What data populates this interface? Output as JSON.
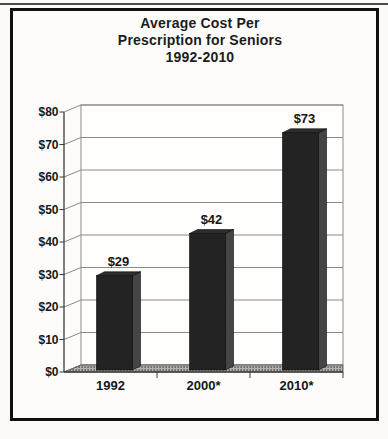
{
  "figure": {
    "title_line1": "Average Cost Per",
    "title_line2": "Prescription for Seniors",
    "title_line3": "1992-2010"
  },
  "chart_data": {
    "type": "bar",
    "style": "3d-column",
    "title": "Average Cost Per Prescription for Seniors 1992-2010",
    "categories": [
      "1992",
      "2000*",
      "2010*"
    ],
    "values": [
      29,
      42,
      73
    ],
    "value_labels": [
      "$29",
      "$42",
      "$73"
    ],
    "series": [
      {
        "name": "Average cost per prescription",
        "values": [
          29,
          42,
          73
        ]
      }
    ],
    "xlabel": "",
    "ylabel": "",
    "ylim": [
      0,
      80
    ],
    "y_step": 10,
    "y_tick_labels": [
      "$0",
      "$10",
      "$20",
      "$30",
      "$40",
      "$50",
      "$60",
      "$70",
      "$80"
    ],
    "grid": true,
    "legend_position": "none",
    "colors": {
      "bar_front": "#232323",
      "bar_side": "#454545",
      "bar_top": "#2d2d2d",
      "bar_edge": "#0a0a0a",
      "floor_base": "#b3b1ae",
      "floor_dot": "#3e3e3e",
      "wall_fill": "#fffefc",
      "gridline": "#8a8a8a",
      "axis": "#3c3c3c",
      "text": "#161616",
      "frame_border": "#101010",
      "background": "#fbfaf7"
    }
  }
}
